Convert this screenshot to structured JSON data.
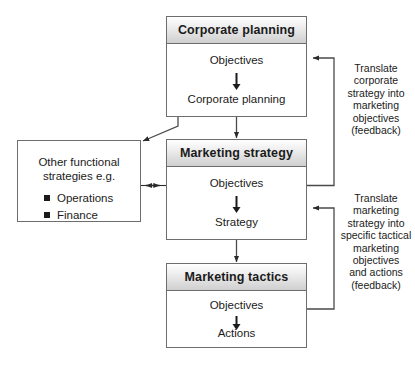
{
  "diagram": {
    "boxes": [
      {
        "id": "corporate-planning",
        "header": "Corporate planning",
        "stage_top": "Objectives",
        "stage_bottom": "Corporate planning"
      },
      {
        "id": "marketing-strategy",
        "header": "Marketing strategy",
        "stage_top": "Objectives",
        "stage_bottom": "Strategy"
      },
      {
        "id": "marketing-tactics",
        "header": "Marketing tactics",
        "stage_top": "Objectives",
        "stage_bottom": "Actions"
      }
    ],
    "side_box": {
      "id": "other-functional-strategies",
      "title_line1": "Other functional",
      "title_line2": "strategies e.g.",
      "bullets": [
        "Operations",
        "Finance"
      ]
    },
    "notes": [
      {
        "id": "feedback-corporate",
        "lines": [
          "Translate",
          "corporate",
          "strategy into",
          "marketing",
          "objectives",
          "(feedback)"
        ]
      },
      {
        "id": "feedback-tactics",
        "lines": [
          "Translate",
          "marketing",
          "strategy into",
          "specific tactical",
          "marketing",
          "objectives",
          "and actions",
          "(feedback)"
        ]
      }
    ],
    "colors": {
      "border": "#6d6d6d",
      "header_gradient_start": "#ffffff",
      "header_gradient_end": "#cfcfcf",
      "connector": "#4a4a4a",
      "text": "#1b1b1b",
      "background": "#ffffff"
    }
  }
}
